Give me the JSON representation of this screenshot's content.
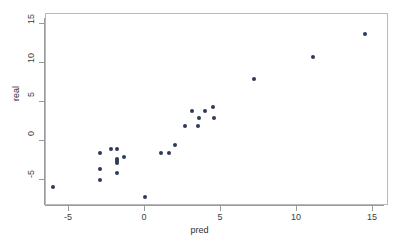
{
  "chart_data": {
    "type": "scatter",
    "title": "",
    "xlabel": "pred",
    "ylabel": "real",
    "xlim": [
      -7.2,
      15.9
    ],
    "ylim": [
      -7.6,
      16.6
    ],
    "xticks": [
      -5,
      0,
      5,
      10,
      15
    ],
    "yticks": [
      -5,
      0,
      5,
      10,
      15
    ],
    "xticklabels": [
      "-5",
      "0",
      "5",
      "10",
      "15"
    ],
    "yticklabels": [
      "-5",
      "0",
      "5",
      "10",
      "15"
    ],
    "grid": false,
    "legend": null,
    "marker": "filled-circle",
    "marker_color": "#2c3a5b",
    "series": [
      {
        "name": "points",
        "points": [
          {
            "x": -6.05,
            "y": -5.9
          },
          {
            "x": -2.95,
            "y": -1.5
          },
          {
            "x": -2.95,
            "y": -3.55
          },
          {
            "x": -2.95,
            "y": -5.0
          },
          {
            "x": -2.25,
            "y": -1.05
          },
          {
            "x": -1.85,
            "y": -1.05
          },
          {
            "x": -1.85,
            "y": -2.25
          },
          {
            "x": -1.85,
            "y": -2.55
          },
          {
            "x": -1.85,
            "y": -2.85
          },
          {
            "x": -1.85,
            "y": -4.1
          },
          {
            "x": -1.35,
            "y": -2.0
          },
          {
            "x": 0.0,
            "y": -7.15
          },
          {
            "x": 1.05,
            "y": -1.55
          },
          {
            "x": 1.55,
            "y": -1.55
          },
          {
            "x": 2.0,
            "y": -0.55
          },
          {
            "x": 2.6,
            "y": 1.95
          },
          {
            "x": 3.1,
            "y": 3.9
          },
          {
            "x": 3.5,
            "y": 1.95
          },
          {
            "x": 3.55,
            "y": 2.9
          },
          {
            "x": 3.95,
            "y": 3.9
          },
          {
            "x": 4.5,
            "y": 4.35
          },
          {
            "x": 4.55,
            "y": 2.9
          },
          {
            "x": 7.15,
            "y": 7.9
          },
          {
            "x": 11.05,
            "y": 10.8
          },
          {
            "x": 14.45,
            "y": 13.75
          }
        ]
      }
    ]
  },
  "axes": {
    "x_label": "pred",
    "y_label": "real"
  }
}
